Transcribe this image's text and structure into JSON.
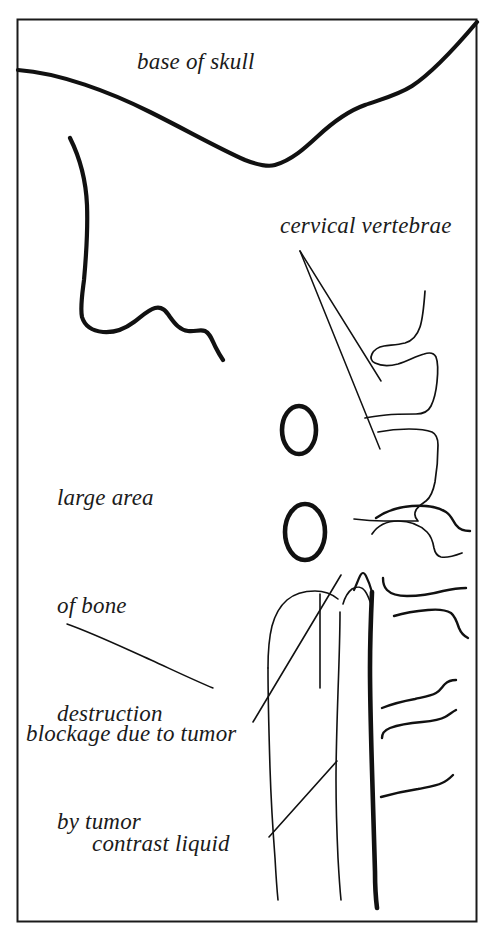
{
  "figure": {
    "kind": "medical-line-drawing",
    "background_color": "#ffffff",
    "ink_color": "#111111",
    "border": {
      "color": "#1a1a1a",
      "x": 17,
      "y": 19,
      "width": 460,
      "height": 903,
      "stroke_width": 2
    }
  },
  "labels": {
    "base_of_skull": "base of skull",
    "cervical_vertebrae": "cervical vertebrae",
    "bone_destruction": {
      "line1": "large area",
      "line2": "of bone",
      "line3": "destruction",
      "line4": "by tumor"
    },
    "blockage": "blockage due to tumor",
    "contrast_liquid": "contrast liquid"
  },
  "drawing_elements": [
    {
      "name": "skull-base-curve",
      "description": "heavy curve sweeping from left edge down to a trough then rising to top-right corner"
    },
    {
      "name": "soft-tissue-curve",
      "description": "heavy wavy curve in upper-left quadrant"
    },
    {
      "name": "vertebra-body-upper",
      "description": "outlined cervical vertebral body block"
    },
    {
      "name": "vertebra-body-lower",
      "description": "outlined cervical vertebral body block"
    },
    {
      "name": "lesion-oval-upper",
      "description": "bold small oval marking bone destruction"
    },
    {
      "name": "lesion-oval-lower",
      "description": "bold larger oval marking bone destruction"
    },
    {
      "name": "contrast-column",
      "description": "vertical column of contrast liquid with blockage"
    },
    {
      "name": "spinal-canal-posterior-line",
      "description": "thick vertical posterior margin line"
    },
    {
      "name": "vertebral-endplate-lines",
      "description": "series of horizontal curved endplate lines on the right"
    },
    {
      "name": "leader-line-cervical-vertebrae-a",
      "description": "thin pointer from cervical vertebrae label to upper vertebral body"
    },
    {
      "name": "leader-line-cervical-vertebrae-b",
      "description": "thin pointer from cervical vertebrae label to lower vertebral body"
    },
    {
      "name": "leader-line-bone-destruction",
      "description": "thin pointer from bone destruction label toward lesion"
    },
    {
      "name": "leader-line-blockage",
      "description": "thin pointer from blockage label up to contrast column"
    },
    {
      "name": "leader-line-contrast-liquid",
      "description": "thin pointer from contrast liquid label up to contrast column"
    }
  ]
}
